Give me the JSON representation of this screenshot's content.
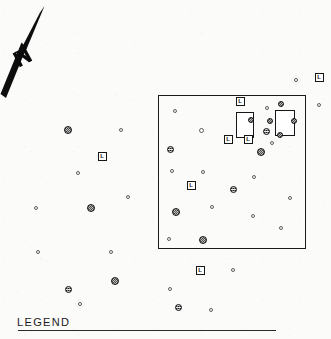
{
  "document": {
    "type": "archaeological-site-plan",
    "title": "Site Plan",
    "background_color": "#fbfbfa",
    "ink_color": "#161616",
    "width": 331,
    "height": 339
  },
  "north_arrow": {
    "name": "north-arrow",
    "label": "N",
    "orientation": "up-right diagonal",
    "color": "#0d0d0d",
    "x": 0,
    "y": 2,
    "w": 62,
    "h": 104
  },
  "survey_box": {
    "name": "survey-area-boundary",
    "label": "Survey Area Boundary",
    "x": 158,
    "y": 95,
    "w": 148,
    "h": 154,
    "stroke": "#1b1b1b"
  },
  "legend": {
    "label": "LEGEND",
    "rule_x": 17,
    "rule_y": 330,
    "rule_width": 258
  },
  "symbol_key": {
    "dot_open": "minor-feature-open-circle",
    "dot_solid": "major-feature-hatched-circle",
    "sq_l": "lettered-station-square",
    "structure": "structure-outline-rectangle"
  },
  "structures": [
    {
      "id": "S1",
      "x": 236,
      "y": 112,
      "w": 18,
      "h": 26
    },
    {
      "id": "S2",
      "x": 275,
      "y": 110,
      "w": 20,
      "h": 26
    }
  ],
  "squares_l": [
    {
      "id": "L1",
      "label": "L",
      "x": 240,
      "y": 101,
      "s": 9
    },
    {
      "id": "L2",
      "label": "L",
      "x": 228,
      "y": 139,
      "s": 9
    },
    {
      "id": "L3",
      "label": "L",
      "x": 248,
      "y": 139,
      "s": 9
    },
    {
      "id": "L4",
      "label": "L",
      "x": 191,
      "y": 185,
      "s": 9
    },
    {
      "id": "L5",
      "label": "L",
      "x": 102,
      "y": 156,
      "s": 9
    },
    {
      "id": "L6",
      "label": "L",
      "x": 200,
      "y": 270,
      "s": 9
    },
    {
      "id": "L7",
      "label": "L",
      "x": 319,
      "y": 77,
      "s": 9
    }
  ],
  "dots_solid": [
    {
      "id": "M1",
      "x": 68,
      "y": 130,
      "d": 8
    },
    {
      "id": "M2",
      "x": 170,
      "y": 149,
      "d": 7
    },
    {
      "id": "M3",
      "x": 251,
      "y": 120,
      "d": 6
    },
    {
      "id": "M4",
      "x": 270,
      "y": 121,
      "d": 6
    },
    {
      "id": "M5",
      "x": 281,
      "y": 104,
      "d": 6
    },
    {
      "id": "M6",
      "x": 294,
      "y": 121,
      "d": 6
    },
    {
      "id": "M7",
      "x": 280,
      "y": 135,
      "d": 6
    },
    {
      "id": "M8",
      "x": 266,
      "y": 131,
      "d": 7
    },
    {
      "id": "M9",
      "x": 261,
      "y": 152,
      "d": 8
    },
    {
      "id": "M10",
      "x": 91,
      "y": 208,
      "d": 8
    },
    {
      "id": "M11",
      "x": 233,
      "y": 189,
      "d": 7
    },
    {
      "id": "M12",
      "x": 176,
      "y": 212,
      "d": 8
    },
    {
      "id": "M13",
      "x": 203,
      "y": 240,
      "d": 8
    },
    {
      "id": "M14",
      "x": 115,
      "y": 281,
      "d": 8
    },
    {
      "id": "M15",
      "x": 68,
      "y": 289,
      "d": 7
    },
    {
      "id": "M16",
      "x": 178,
      "y": 307,
      "d": 7
    }
  ],
  "dots_open": [
    {
      "id": "m1",
      "x": 296,
      "y": 80,
      "d": 4
    },
    {
      "id": "m2",
      "x": 319,
      "y": 105,
      "d": 4
    },
    {
      "id": "m3",
      "x": 175,
      "y": 111,
      "d": 4
    },
    {
      "id": "m4",
      "x": 201,
      "y": 130,
      "d": 5
    },
    {
      "id": "m5",
      "x": 267,
      "y": 108,
      "d": 4
    },
    {
      "id": "m6",
      "x": 272,
      "y": 143,
      "d": 4
    },
    {
      "id": "m7",
      "x": 121,
      "y": 130,
      "d": 4
    },
    {
      "id": "m8",
      "x": 78,
      "y": 173,
      "d": 4
    },
    {
      "id": "m9",
      "x": 172,
      "y": 171,
      "d": 4
    },
    {
      "id": "m10",
      "x": 203,
      "y": 172,
      "d": 4
    },
    {
      "id": "m11",
      "x": 254,
      "y": 177,
      "d": 4
    },
    {
      "id": "m12",
      "x": 128,
      "y": 197,
      "d": 4
    },
    {
      "id": "m13",
      "x": 36,
      "y": 208,
      "d": 4
    },
    {
      "id": "m14",
      "x": 212,
      "y": 207,
      "d": 4
    },
    {
      "id": "m15",
      "x": 290,
      "y": 198,
      "d": 4
    },
    {
      "id": "m16",
      "x": 253,
      "y": 216,
      "d": 4
    },
    {
      "id": "m17",
      "x": 281,
      "y": 228,
      "d": 4
    },
    {
      "id": "m18",
      "x": 169,
      "y": 239,
      "d": 4
    },
    {
      "id": "m19",
      "x": 38,
      "y": 252,
      "d": 4
    },
    {
      "id": "m20",
      "x": 111,
      "y": 252,
      "d": 4
    },
    {
      "id": "m21",
      "x": 233,
      "y": 270,
      "d": 4
    },
    {
      "id": "m22",
      "x": 170,
      "y": 289,
      "d": 4
    },
    {
      "id": "m23",
      "x": 80,
      "y": 304,
      "d": 4
    },
    {
      "id": "m24",
      "x": 211,
      "y": 310,
      "d": 4
    }
  ]
}
